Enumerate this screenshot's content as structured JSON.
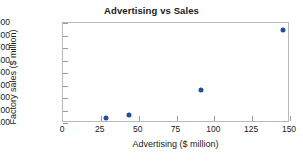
{
  "chart_data": {
    "type": "scatter",
    "title": "Advertising vs Sales",
    "xlabel": "Advertising ($ million)",
    "ylabel": "Factory sales ($ million)",
    "xlim": [
      0,
      150
    ],
    "ylim": [
      100,
      900
    ],
    "xticks": [
      0,
      25,
      50,
      75,
      100,
      125,
      150
    ],
    "xtick_labels": [
      "0",
      "25",
      "50",
      "75",
      "100",
      "125",
      "150"
    ],
    "yticks": [
      100,
      200,
      300,
      400,
      500,
      600,
      700,
      800,
      900
    ],
    "ytick_labels": [
      "100",
      "200",
      "300",
      "400",
      "500",
      "600",
      "700",
      "800",
      "900"
    ],
    "grid": false,
    "legend": null,
    "marker_color": "#1f4e9c",
    "points": [
      {
        "x": 29,
        "y": 130
      },
      {
        "x": 44,
        "y": 160
      },
      {
        "x": 92,
        "y": 355
      },
      {
        "x": 146,
        "y": 840
      }
    ]
  }
}
